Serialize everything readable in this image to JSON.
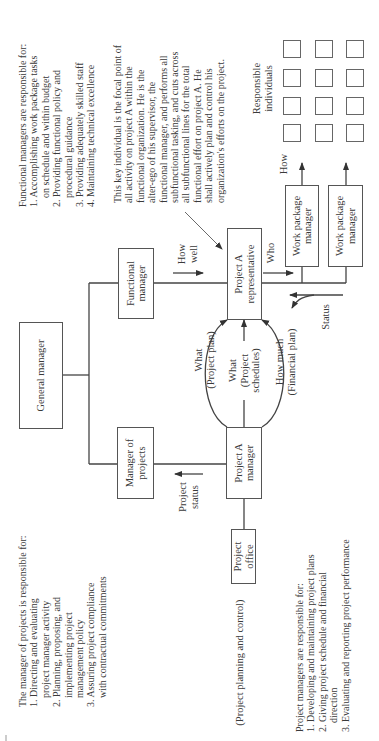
{
  "diagram": {
    "boxes": {
      "general_manager": "General manager",
      "functional_manager": [
        "Functional",
        "manager"
      ],
      "manager_of_projects": [
        "Manager of",
        "projects"
      ],
      "project_a_representative": [
        "Project A",
        "representative"
      ],
      "project_a_manager": [
        "Project A",
        "manager"
      ],
      "project_office": [
        "Project",
        "office"
      ],
      "work_package_managers": [
        [
          "Work package",
          "manager"
        ],
        [
          "Work package",
          "manager"
        ]
      ]
    },
    "responsible_individuals": {
      "label": [
        "Responsible",
        "individuals"
      ],
      "rows": 3,
      "columns": 4
    },
    "flow_labels": {
      "how_well": [
        "How",
        "well"
      ],
      "who": "Who",
      "how": "How",
      "status": "Status",
      "project_status": [
        "Project",
        "status"
      ],
      "what_project_plan": [
        "What",
        "(Project plan)"
      ],
      "what_project_schedules": [
        "What",
        "(Project",
        "schedules)"
      ],
      "how_much_financial_plan": [
        "How much",
        "(Financial plan)"
      ],
      "project_planning_and_control": "(Project planning and control)"
    },
    "notes": {
      "functional_managers": {
        "heading": "Functional managers are responsible for:",
        "lines": [
          "1. Accomplishing work package tasks",
          "on schedule and within budget",
          "2. Providing functional policy and",
          "procedural guidance",
          "3. Providing adequately skilled staff",
          "4. Maintaining technical excellence"
        ]
      },
      "key_individual": {
        "lines": [
          "This key individual is the focal point of",
          "all activity on project A within the",
          "functional organization.  He is the",
          "alter-ego of his supervisor, the",
          "functional manager, and performs all",
          "subfunctional tasking, and cuts across",
          "all subfunctional lines for the total",
          "functional effort on project A.  He",
          "shall actively plan and control his",
          "organization's efforts on the project."
        ]
      },
      "manager_of_projects": {
        "heading": "The manager of projects is responsible for:",
        "lines": [
          "1. Directing and evaluating",
          "project manager activity",
          "2. Planning, proposing, and",
          "implementing project",
          "management policy",
          "3. Assuring project compliance",
          "with contractual commitments"
        ]
      },
      "project_managers": {
        "heading": "Project managers are responsible for:",
        "lines": [
          "1. Developing and maintaining project plans",
          "2. Giving project schedule and financial",
          "direction",
          "3. Evaluating and reporting project performance"
        ]
      }
    }
  }
}
